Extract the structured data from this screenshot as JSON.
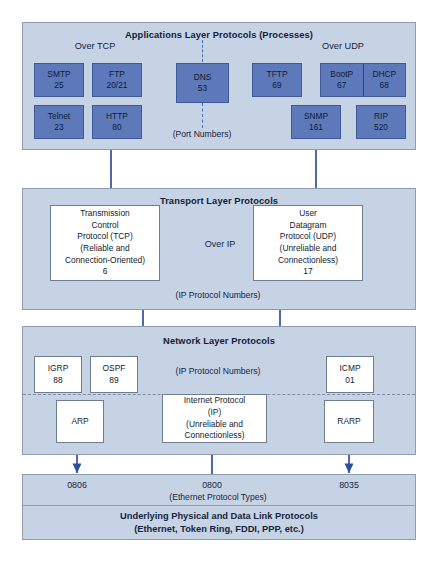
{
  "application_layer": {
    "title": "Applications Layer Protocols (Processes)",
    "over_tcp_label": "Over TCP",
    "over_udp_label": "Over UDP",
    "port_numbers_label": "(Port Numbers)",
    "tcp_protocols": [
      {
        "name": "SMTP",
        "port": "25"
      },
      {
        "name": "FTP",
        "port": "20/21"
      },
      {
        "name": "Telnet",
        "port": "23"
      },
      {
        "name": "HTTP",
        "port": "80"
      }
    ],
    "dns": {
      "name": "DNS",
      "port": "53"
    },
    "udp_protocols": [
      {
        "name": "TFTP",
        "port": "69"
      },
      {
        "name": "BootP",
        "port": "67"
      },
      {
        "name": "DHCP",
        "port": "68"
      },
      {
        "name": "SNMP",
        "port": "161"
      },
      {
        "name": "RIP",
        "port": "520"
      }
    ]
  },
  "transport_layer": {
    "title": "Transport Layer Protocols",
    "over_ip_label": "Over IP",
    "ip_protocol_numbers_label": "(IP Protocol Numbers)",
    "tcp": {
      "line1": "Transmission",
      "line2": "Control",
      "line3": "Protocol (TCP)",
      "line4": "(Reliable and",
      "line5": "Connection-Oriented)",
      "number": "6"
    },
    "udp": {
      "line1": "User",
      "line2": "Datagram",
      "line3": "Protocol (UDP)",
      "line4": "(Unreliable and",
      "line5": "Connectionless)",
      "number": "17"
    }
  },
  "network_layer": {
    "title": "Network Layer Protocols",
    "ip_protocol_numbers_label": "(IP Protocol Numbers)",
    "routing_protocols": [
      {
        "name": "IGRP",
        "number": "88"
      },
      {
        "name": "OSPF",
        "number": "89"
      }
    ],
    "icmp": {
      "name": "ICMP",
      "number": "01"
    },
    "arp": {
      "name": "ARP"
    },
    "rarp": {
      "name": "RARP"
    },
    "ip": {
      "line1": "Internet Protocol",
      "line2": "(IP)",
      "line3": "(Unreliable and",
      "line4": "Connectionless)"
    }
  },
  "link_layer": {
    "ethernet_types_label": "(Ethernet Protocol Types)",
    "type_arp": "0806",
    "type_ip": "0800",
    "type_rarp": "8035",
    "title_line1": "Underlying Physical and Data Link Protocols",
    "title_line2": "(Ethernet, Token Ring, FDDI, PPP, etc.)"
  },
  "colors": {
    "panel_fill": "#c6d3e4",
    "panel_border": "#8d9dae",
    "protocol_blue": "#5d79ba",
    "connector_blue": "#2f4f9e",
    "dashed_blue": "#4a6cbd",
    "text_dark": "#101c33"
  }
}
